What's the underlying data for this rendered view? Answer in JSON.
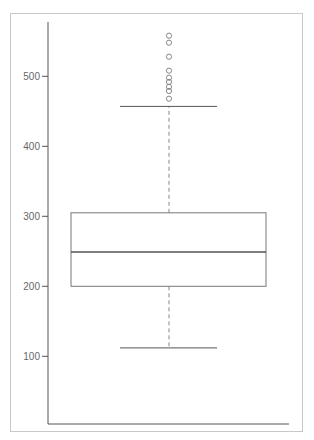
{
  "chart_data": {
    "type": "box",
    "title": "",
    "xlabel": "",
    "ylabel": "",
    "ylim": [
      0,
      600
    ],
    "yticks": [
      100,
      200,
      300,
      400,
      500
    ],
    "ytick_labels": [
      "100",
      "200",
      "300",
      "400",
      "500"
    ],
    "grid": false,
    "legend": null,
    "series": [
      {
        "name": "",
        "whisker_low": 112,
        "q1": 200,
        "median": 249,
        "q3": 305,
        "whisker_high": 457,
        "outliers": [
          468,
          479,
          485,
          492,
          498,
          508,
          528,
          548,
          558
        ]
      }
    ]
  },
  "colors": {
    "axis": "#555555",
    "box": "#777777",
    "median": "#555555",
    "whisker": "#888888",
    "outlier": "#888888",
    "frame": "#c8c8c8",
    "tick_label": "#666666"
  }
}
